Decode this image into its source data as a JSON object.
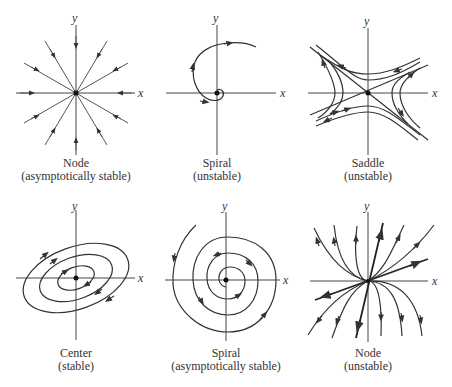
{
  "figure": {
    "axis_labels": {
      "x": "x",
      "y": "y"
    },
    "panels": [
      {
        "id": "node-stable",
        "title": "Node",
        "subtitle": "(asymptotically stable)"
      },
      {
        "id": "spiral-unstable",
        "title": "Spiral",
        "subtitle": "(unstable)"
      },
      {
        "id": "saddle",
        "title": "Saddle",
        "subtitle": "(unstable)"
      },
      {
        "id": "center",
        "title": "Center",
        "subtitle": "(stable)"
      },
      {
        "id": "spiral-stable",
        "title": "Spiral",
        "subtitle": "(asymptotically stable)"
      },
      {
        "id": "node-unstable",
        "title": "Node",
        "subtitle": "(unstable)"
      }
    ]
  }
}
